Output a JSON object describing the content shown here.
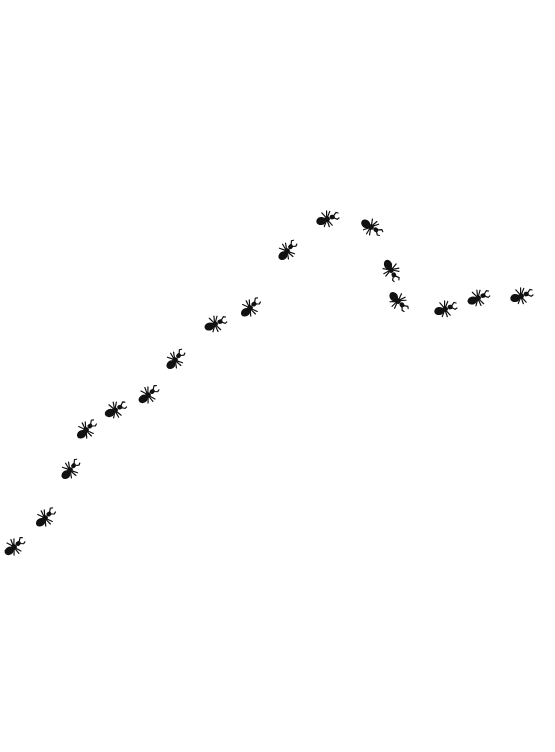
{
  "scene": {
    "description": "Line of black ants marching across a white background",
    "background": "#ffffff",
    "ant_color": "#111111",
    "ants": [
      {
        "x": 14,
        "y": 547,
        "angle": -30
      },
      {
        "x": 45,
        "y": 518,
        "angle": -35
      },
      {
        "x": 70,
        "y": 470,
        "angle": -40
      },
      {
        "x": 86,
        "y": 430,
        "angle": -35
      },
      {
        "x": 115,
        "y": 410,
        "angle": -20
      },
      {
        "x": 148,
        "y": 395,
        "angle": -30
      },
      {
        "x": 175,
        "y": 360,
        "angle": -40
      },
      {
        "x": 215,
        "y": 324,
        "angle": -15
      },
      {
        "x": 250,
        "y": 308,
        "angle": -35
      },
      {
        "x": 287,
        "y": 251,
        "angle": -40
      },
      {
        "x": 327,
        "y": 219,
        "angle": -10
      },
      {
        "x": 371,
        "y": 227,
        "angle": 40
      },
      {
        "x": 391,
        "y": 270,
        "angle": 70
      },
      {
        "x": 398,
        "y": 301,
        "angle": 55
      },
      {
        "x": 445,
        "y": 309,
        "angle": -10
      },
      {
        "x": 478,
        "y": 298,
        "angle": -15
      },
      {
        "x": 521,
        "y": 296,
        "angle": -10
      }
    ]
  }
}
